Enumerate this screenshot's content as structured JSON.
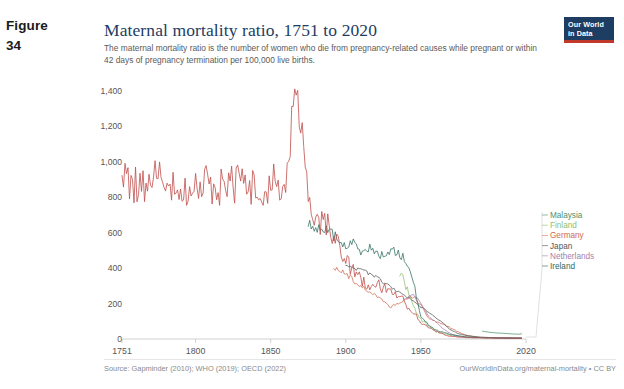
{
  "figure": {
    "word": "Figure",
    "number": "34"
  },
  "header": {
    "title": "Maternal mortality ratio, 1751 to 2020",
    "subtitle": "The maternal mortality ratio is the number of women who die from pregnancy-related causes while pregnant or within 42 days of pregnancy termination per 100,000 live births.",
    "logo_line1": "Our World",
    "logo_line2": "in Data"
  },
  "footer": {
    "source": "Source: Gapminder (2010); WHO (2019); OECD (2022)",
    "attribution": "OurWorldInData.org/maternal-mortality • CC BY"
  },
  "chart_data": {
    "type": "line",
    "title": "Maternal mortality ratio, 1751 to 2020",
    "subtitle": "The maternal mortality ratio is the number of women who die from pregnancy-related causes while pregnant or within 42 days of pregnancy termination per 100,000 live births.",
    "xlabel": "",
    "ylabel": "",
    "xlim": [
      1751,
      2020
    ],
    "ylim": [
      0,
      1450
    ],
    "grid": false,
    "legend_position": "right",
    "xticks": [
      1751,
      1800,
      1850,
      1900,
      1950,
      2020
    ],
    "xtick_labels": [
      "1751",
      "1800",
      "1850",
      "1900",
      "1950",
      "2020"
    ],
    "yticks": [
      0,
      200,
      400,
      600,
      800,
      1000,
      1200,
      1400
    ],
    "ytick_labels": [
      "0",
      "200",
      "400",
      "600",
      "800",
      "1,000",
      "1,200",
      "1,400"
    ],
    "series": [
      {
        "name": "Malaysia",
        "color": "#4d8f6b",
        "x": [
          1991,
          1995,
          2000,
          2005,
          2010,
          2015,
          2017
        ],
        "values": [
          44,
          39,
          34,
          32,
          29,
          27,
          29
        ]
      },
      {
        "name": "Finland",
        "color": "#8fbf6e",
        "x": [
          1936,
          1940,
          1945,
          1950,
          1955,
          1960,
          1970,
          1980,
          1990,
          2000,
          2010,
          2017
        ],
        "values": [
          380,
          300,
          190,
          110,
          70,
          45,
          20,
          10,
          7,
          6,
          5,
          3
        ]
      },
      {
        "name": "Germany",
        "color": "#cf6a4e",
        "x": [
          1892,
          1895,
          1900,
          1905,
          1910,
          1915,
          1920,
          1925,
          1930,
          1935,
          1940,
          1945,
          1950,
          1955,
          1960,
          1965,
          1970,
          1975,
          1980,
          1985,
          1990,
          1995,
          2000,
          2010,
          2017
        ],
        "values": [
          400,
          392,
          370,
          330,
          300,
          270,
          250,
          210,
          175,
          205,
          230,
          240,
          190,
          120,
          100,
          82,
          60,
          40,
          22,
          12,
          9,
          8,
          7,
          6,
          6
        ]
      },
      {
        "name": "Japan",
        "color": "#555555",
        "x": [
          1900,
          1910,
          1920,
          1930,
          1940,
          1950,
          1955,
          1960,
          1965,
          1970,
          1975,
          1980,
          1990,
          2000,
          2010,
          2017
        ],
        "values": [
          410,
          390,
          350,
          290,
          240,
          180,
          150,
          120,
          88,
          50,
          30,
          20,
          10,
          7,
          5,
          4
        ]
      },
      {
        "name": "Netherlands",
        "color": "#a37fae",
        "x": [
          1940,
          1945,
          1950,
          1955,
          1960,
          1965,
          1970,
          1975,
          1980,
          1990,
          2000,
          2010,
          2017
        ],
        "values": [
          230,
          255,
          200,
          130,
          95,
          55,
          30,
          15,
          10,
          8,
          7,
          6,
          5
        ]
      },
      {
        "name": "Ireland",
        "color": "#2f6b5e",
        "x": [
          1875,
          1880,
          1885,
          1890,
          1895,
          1900,
          1905,
          1910,
          1915,
          1920,
          1925,
          1930,
          1935,
          1940,
          1945,
          1950,
          1955,
          1960,
          1970,
          1980,
          1990,
          2000,
          2010,
          2017
        ],
        "values": [
          650,
          640,
          620,
          600,
          560,
          520,
          540,
          500,
          520,
          480,
          470,
          510,
          480,
          450,
          320,
          130,
          80,
          50,
          25,
          12,
          8,
          6,
          5,
          5
        ]
      },
      {
        "name": "Sweden",
        "color": "#c0504d",
        "x": [
          1751,
          1760,
          1770,
          1780,
          1790,
          1800,
          1810,
          1820,
          1830,
          1840,
          1850,
          1860,
          1868,
          1875,
          1880,
          1890,
          1900,
          1910,
          1920,
          1930,
          1940,
          1950,
          1960,
          1970,
          1980,
          1990,
          2000,
          2010,
          2017
        ],
        "values": [
          900,
          860,
          880,
          950,
          820,
          900,
          870,
          840,
          900,
          830,
          880,
          900,
          1450,
          760,
          700,
          620,
          430,
          330,
          300,
          280,
          200,
          95,
          40,
          15,
          8,
          6,
          5,
          5,
          4
        ]
      }
    ]
  },
  "legend": {
    "items": [
      {
        "label": "Malaysia",
        "color": "#4d8f6b"
      },
      {
        "label": "Finland",
        "color": "#8fbf6e"
      },
      {
        "label": "Germany",
        "color": "#cf6a4e"
      },
      {
        "label": "Japan",
        "color": "#555555"
      },
      {
        "label": "Netherlands",
        "color": "#a37fae"
      },
      {
        "label": "Ireland",
        "color": "#2f6b5e"
      }
    ]
  }
}
